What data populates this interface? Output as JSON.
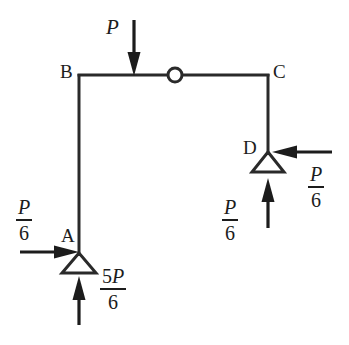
{
  "figure": {
    "background_color": "#ffffff",
    "line_color": "#2a2a2a",
    "force_color": "#1c1c1c"
  },
  "joints": [
    {
      "id": "A",
      "label": "A",
      "x": 79,
      "y": 253,
      "label_x": 63,
      "label_y": 228,
      "support": "pin-triangle"
    },
    {
      "id": "B",
      "label": "B",
      "x": 79,
      "y": 75,
      "label_x": 60,
      "label_y": 62,
      "support": "none"
    },
    {
      "id": "C",
      "label": "C",
      "x": 268,
      "y": 75,
      "label_x": 273,
      "label_y": 62,
      "support": "none"
    },
    {
      "id": "D",
      "label": "D",
      "x": 268,
      "y": 152,
      "label_x": 242,
      "label_y": 138,
      "support": "pin-triangle"
    }
  ],
  "hinge": {
    "name": "internal-hinge",
    "x": 175,
    "y": 75,
    "radius": 7
  },
  "members": [
    {
      "name": "column-AB",
      "from": "A",
      "to": "B",
      "x1": 79,
      "y1": 255,
      "x2": 79,
      "y2": 75
    },
    {
      "name": "beam-BC",
      "from": "B",
      "to": "C",
      "x1": 78,
      "y1": 75,
      "x2": 269,
      "y2": 75
    },
    {
      "name": "column-CD",
      "from": "C",
      "to": "D",
      "x1": 268,
      "y1": 75,
      "x2": 268,
      "y2": 154
    }
  ],
  "forces": [
    {
      "name": "applied-load-P",
      "label_text": "P",
      "label_kind": "scalar",
      "direction": "down",
      "x": 134,
      "tail_y": 20,
      "tip_y": 75,
      "label_x": 107,
      "label_y": 18
    },
    {
      "name": "reaction-A-horizontal",
      "label_text": "P/6",
      "label_kind": "fraction",
      "numerator": "P",
      "denominator": "6",
      "direction": "right",
      "y": 252,
      "tail_x": 20,
      "tip_x": 78,
      "label_x": 16,
      "label_y": 198
    },
    {
      "name": "reaction-A-vertical",
      "label_text": "5P/6",
      "label_kind": "fraction",
      "numerator": "5P",
      "denominator": "6",
      "direction": "up",
      "x": 79,
      "tail_y": 325,
      "tip_y": 276,
      "label_x": 100,
      "label_y": 268
    },
    {
      "name": "reaction-D-vertical",
      "label_text": "P/6",
      "label_kind": "fraction",
      "numerator": "P",
      "denominator": "6",
      "direction": "up",
      "x": 268,
      "tail_y": 228,
      "tip_y": 178,
      "label_x": 222,
      "label_y": 198
    },
    {
      "name": "reaction-D-horizontal",
      "label_text": "P/6",
      "label_kind": "fraction",
      "numerator": "P",
      "denominator": "6",
      "direction": "left",
      "y": 152,
      "tail_x": 332,
      "tip_x": 272,
      "label_x": 308,
      "label_y": 165
    }
  ],
  "labels": {
    "joint_A": "A",
    "joint_B": "B",
    "joint_C": "C",
    "joint_D": "D",
    "load_P": "P",
    "frac_num_P": "P",
    "frac_num_5P_digit": "5",
    "frac_num_5P_var": "P",
    "frac_den_6": "6"
  }
}
